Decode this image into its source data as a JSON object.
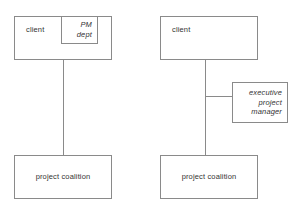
{
  "diagram": {
    "stroke_color": "#8a8a8a",
    "text_color": "#333333",
    "background_color": "#ffffff",
    "left": {
      "name": "client with internal PM department",
      "client": {
        "label": "client"
      },
      "pm_dept": {
        "label": "PM\ndept"
      },
      "coalition": {
        "label": "project coalition"
      },
      "connector": {
        "from": "client",
        "to": "project coalition"
      }
    },
    "right": {
      "name": "client with external executive project manager",
      "client": {
        "label": "client"
      },
      "executive_project_manager": {
        "label": "executive\nproject\nmanager"
      },
      "coalition": {
        "label": "project coalition"
      },
      "connector": {
        "from": "client",
        "to": "project coalition"
      },
      "branch_connector": {
        "from": "client-coalition line",
        "to": "executive project manager"
      }
    }
  }
}
